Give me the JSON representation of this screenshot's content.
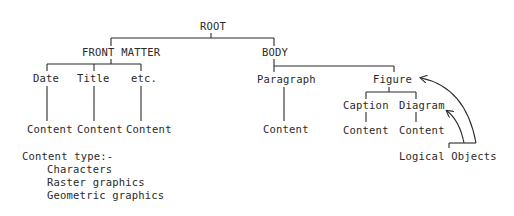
{
  "tree": {
    "root": "ROOT",
    "front_matter": {
      "label": "FRONT MATTER",
      "children": [
        {
          "label": "Date",
          "content": "Content"
        },
        {
          "label": "Title",
          "content": "Content"
        },
        {
          "label": "etc.",
          "content": "Content"
        }
      ]
    },
    "body": {
      "label": "BODY",
      "paragraph": {
        "label": "Paragraph",
        "content": "Content"
      },
      "figure": {
        "label": "Figure",
        "children": [
          {
            "label": "Caption",
            "content": "Content"
          },
          {
            "label": "Diagram",
            "content": "Content"
          }
        ]
      }
    }
  },
  "content_types": {
    "heading": "Content type:-",
    "items": [
      "Characters",
      "Raster graphics",
      "Geometric graphics"
    ]
  },
  "annotation": {
    "label": "Logical Objects",
    "points_to": [
      "Figure",
      "Diagram"
    ]
  },
  "colors": {
    "line": "#2a2a2a",
    "background": "#ffffff"
  }
}
